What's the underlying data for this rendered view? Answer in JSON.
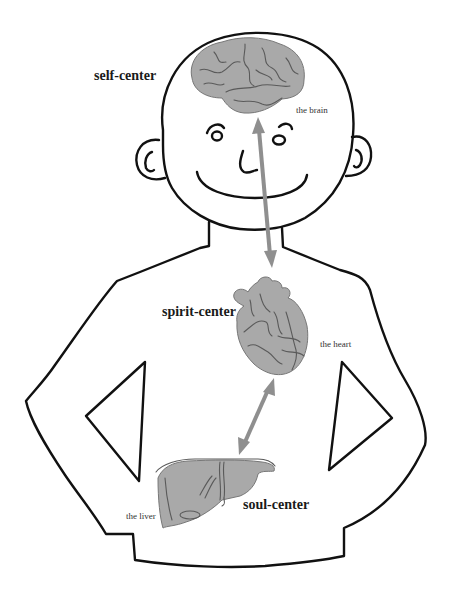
{
  "diagram": {
    "type": "anatomical-concept-diagram",
    "figure": "cartoon human figure outline with organs",
    "colors": {
      "outline": "#111111",
      "organ_fill": "#a9a9a9",
      "arrow": "#8f8f8f",
      "background": "#ffffff"
    },
    "centers": [
      {
        "id": "self",
        "label": "self-center",
        "organ": "the brain",
        "organ_icon": "brain-icon"
      },
      {
        "id": "spirit",
        "label": "spirit-center",
        "organ": "the heart",
        "organ_icon": "heart-icon"
      },
      {
        "id": "soul",
        "label": "soul-center",
        "organ": "the liver",
        "organ_icon": "liver-icon"
      }
    ],
    "connections": [
      {
        "from": "the brain",
        "to": "the heart",
        "style": "double-headed gray arrow"
      },
      {
        "from": "the heart",
        "to": "the liver",
        "style": "double-headed gray arrow"
      }
    ]
  }
}
